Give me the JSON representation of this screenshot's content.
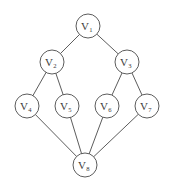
{
  "figure": {
    "kind": "undirected-graph-diagram",
    "background_color": "#ffffff",
    "stroke_color": "#4a4a4a",
    "label_color": "#3a3a3a",
    "node_radius": 12,
    "node_count": 8,
    "edge_count": 10
  },
  "nodes": [
    {
      "id": "v1",
      "base": "V",
      "sub": "1",
      "x": 88,
      "y": 26
    },
    {
      "id": "v2",
      "base": "V",
      "sub": "2",
      "x": 52,
      "y": 62
    },
    {
      "id": "v3",
      "base": "V",
      "sub": "3",
      "x": 127,
      "y": 62
    },
    {
      "id": "v4",
      "base": "V",
      "sub": "4",
      "x": 27,
      "y": 106
    },
    {
      "id": "v5",
      "base": "V",
      "sub": "5",
      "x": 67,
      "y": 106
    },
    {
      "id": "v6",
      "base": "V",
      "sub": "6",
      "x": 107,
      "y": 106
    },
    {
      "id": "v7",
      "base": "V",
      "sub": "7",
      "x": 147,
      "y": 106
    },
    {
      "id": "v8",
      "base": "V",
      "sub": "8",
      "x": 85,
      "y": 165
    }
  ],
  "edges": [
    {
      "from": "v1",
      "to": "v2"
    },
    {
      "from": "v1",
      "to": "v3"
    },
    {
      "from": "v2",
      "to": "v4"
    },
    {
      "from": "v2",
      "to": "v5"
    },
    {
      "from": "v3",
      "to": "v6"
    },
    {
      "from": "v3",
      "to": "v7"
    },
    {
      "from": "v4",
      "to": "v8"
    },
    {
      "from": "v5",
      "to": "v8"
    },
    {
      "from": "v6",
      "to": "v8"
    },
    {
      "from": "v7",
      "to": "v8"
    }
  ]
}
